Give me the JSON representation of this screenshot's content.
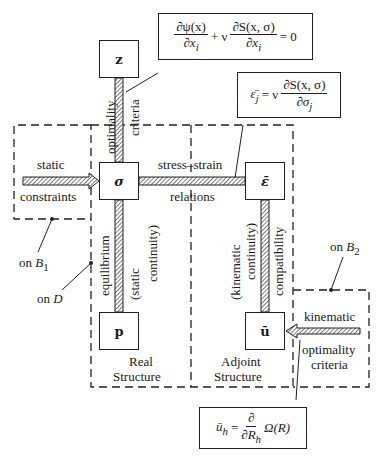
{
  "nodes": {
    "z": "z",
    "sigma": "σ",
    "eps_bar": "ε̄",
    "p": "p",
    "u_bar": "ū"
  },
  "labels": {
    "optimality": "optimality",
    "criteria": "criteria",
    "static": "static",
    "constraints": "constraints",
    "stress_strain": "stress–strain",
    "relations": "relations",
    "equilibrium": "equilibrium",
    "static_continuity_1": "(static",
    "static_continuity_2": "continuity)",
    "kinematic_continuity_1": "(kinematic",
    "kinematic_continuity_2": "continuity)",
    "compatibility": "compatibility",
    "on_B1_on": "on",
    "on_B1_var": "B",
    "on_B1_sub": "1",
    "on_D_on": "on",
    "on_D_var": "D",
    "on_B2_on": "on",
    "on_B2_var": "B",
    "on_B2_sub": "2",
    "kinematic": "kinematic",
    "kin_optimality": "optimality",
    "kin_criteria": "criteria",
    "real_1": "Real",
    "real_2": "Structure",
    "adjoint_1": "Adjoint",
    "adjoint_2": "Structure"
  },
  "equations": {
    "eq1": {
      "t1_num": "∂ψ(x)",
      "t1_den": "∂x",
      "t1_den_sub": "i",
      "plus_nu": "+ ν",
      "t2_num": "∂S(x, σ)",
      "t2_den": "∂x",
      "t2_den_sub": "i",
      "rhs": "= 0"
    },
    "eq2": {
      "lhs": "ε̄",
      "lhs_sub": "j",
      "eq_nu": "= ν",
      "num": "∂S(x, σ)",
      "den": "∂σ",
      "den_sub": "j"
    },
    "eq3": {
      "lhs": "ū",
      "lhs_sub": "h",
      "eq": "=",
      "num": "∂",
      "den": "∂R",
      "den_sub": "h",
      "rhs": "Ω(R)"
    }
  },
  "colors": {
    "ink": "#1a1a1a",
    "background": "#ffffff"
  }
}
